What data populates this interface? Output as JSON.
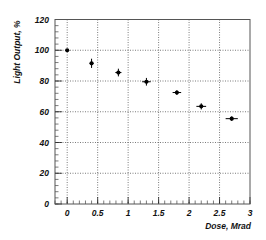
{
  "chart_data": {
    "type": "scatter",
    "title": "",
    "xlabel": "Dose, Mrad",
    "ylabel": "Light Output, %",
    "xlim": [
      -0.2,
      3
    ],
    "ylim": [
      0,
      120
    ],
    "xticks": [
      0,
      0.5,
      1,
      1.5,
      2,
      2.5,
      3
    ],
    "xtick_labels": [
      "0",
      "0.5",
      "1",
      "1.5",
      "2",
      "2.5",
      "3"
    ],
    "yticks": [
      0,
      20,
      40,
      60,
      80,
      100,
      120
    ],
    "ytick_labels": [
      "0",
      "20",
      "40",
      "60",
      "80",
      "100",
      "120"
    ],
    "x_minor_step": 0.1,
    "y_minor_step": 4,
    "grid": true,
    "legend": null,
    "series": [
      {
        "name": "Light Output",
        "x": [
          0,
          0.4,
          0.84,
          1.3,
          1.8,
          2.2,
          2.7
        ],
        "y": [
          100,
          91.5,
          85.5,
          79.5,
          72.5,
          63.5,
          55.5
        ],
        "x_err": [
          0,
          0.03,
          0.05,
          0.07,
          0.07,
          0.08,
          0.1
        ],
        "y_err": [
          0,
          3,
          2.5,
          2.5,
          1.5,
          2,
          1.5
        ]
      }
    ]
  },
  "colors": {
    "frame": "#555555",
    "grid": "#444444",
    "marker": "#000000"
  }
}
